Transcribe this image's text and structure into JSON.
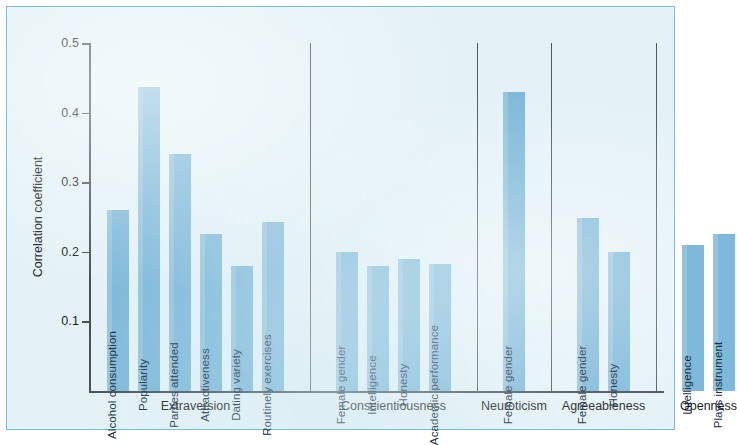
{
  "chart_data": {
    "type": "bar",
    "title": "",
    "xlabel": "",
    "ylabel": "Correlation coefficient",
    "ylim": [
      0,
      0.5
    ],
    "yticks": [
      0.1,
      0.2,
      0.3,
      0.4,
      0.5
    ],
    "ytick_labels": [
      "0.1",
      "0.2",
      "0.3",
      "0.4",
      "0.5"
    ],
    "grid": false,
    "legend": "none",
    "groups": [
      {
        "name": "Extraversion",
        "categories": [
          "Alcohol consumption",
          "Popularity",
          "Parties attended",
          "Attractiveness",
          "Dating variety",
          "Routinely exercises"
        ],
        "values": [
          0.26,
          0.437,
          0.34,
          0.225,
          0.18,
          0.243
        ]
      },
      {
        "name": "Conscientiousness",
        "categories": [
          "Female gender",
          "Intelligence",
          "Honesty",
          "Academic performance"
        ],
        "values": [
          0.2,
          0.18,
          0.19,
          0.183
        ]
      },
      {
        "name": "Neuroticism",
        "categories": [
          "Female gender"
        ],
        "values": [
          0.43
        ]
      },
      {
        "name": "Agreeableness",
        "categories": [
          "Female gender",
          "Honesty"
        ],
        "values": [
          0.248,
          0.2
        ]
      },
      {
        "name": "Openness",
        "categories": [
          "Intelligence",
          "Plays instrument"
        ],
        "values": [
          0.21,
          0.225
        ]
      }
    ],
    "colors": {
      "bar": "#7fb9d9",
      "panel_background": "#e4f2f7",
      "panel_border": "#72c3d4",
      "axis": "#4a4f55",
      "separator": "#53585e",
      "text": "#1c1f24"
    }
  }
}
